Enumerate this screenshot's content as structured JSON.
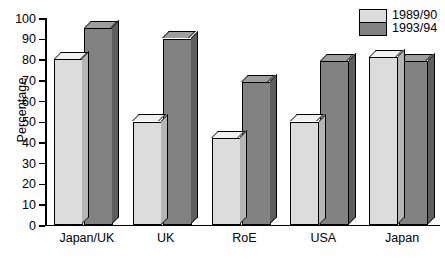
{
  "chart_data": {
    "type": "bar",
    "title": "",
    "subtitle": "",
    "xlabel": "",
    "ylabel": "Percentage",
    "categories": [
      "Japan/UK",
      "UK",
      "RoE",
      "USA",
      "Japan"
    ],
    "series": [
      {
        "name": "1989/90",
        "values": [
          80,
          50,
          42,
          50,
          81
        ],
        "color": "#dcdcdc"
      },
      {
        "name": "1993/94",
        "values": [
          95,
          90,
          69,
          79,
          79
        ],
        "color": "#828282"
      }
    ],
    "ylim": [
      0,
      100
    ],
    "yticks": [
      0,
      10,
      20,
      30,
      40,
      50,
      60,
      70,
      80,
      90,
      100
    ],
    "ytick_labels": [
      "0",
      "10",
      "20",
      "30",
      "40",
      "50",
      "60",
      "70",
      "80",
      "90",
      "100"
    ],
    "grid": false,
    "legend_position": "top-right",
    "style": "3d-bars",
    "colors": {
      "series_1989_90": "#dcdcdc",
      "series_1993_94": "#828282",
      "outline": "#000000",
      "background": "#ffffff"
    }
  },
  "legend": {
    "entries": [
      {
        "label": "1989/90",
        "color": "#dcdcdc"
      },
      {
        "label": "1993/94",
        "color": "#828282"
      }
    ]
  }
}
